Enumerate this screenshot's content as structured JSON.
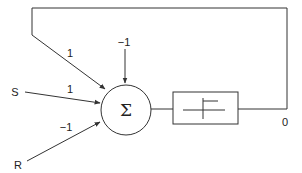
{
  "diagram": {
    "type": "neuron-feedback",
    "inputs": [
      {
        "name": "S",
        "weight": "1"
      },
      {
        "name": "R",
        "weight": "-1"
      }
    ],
    "feedback_weight": "1",
    "bias": "−1",
    "node_symbol": "Σ",
    "activation": "step-function",
    "output_label": "0",
    "labels": {
      "s_input": "S",
      "r_input": "R",
      "w_feedback": "1",
      "w_s": "1",
      "w_r": "−1",
      "bias": "−1",
      "sum": "Σ",
      "output": "0"
    },
    "colors": {
      "line": "#333333",
      "background": "#ffffff"
    }
  }
}
